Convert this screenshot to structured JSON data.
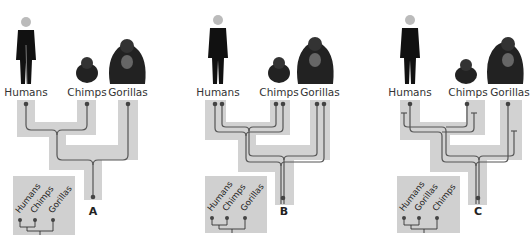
{
  "panels": [
    {
      "letter": "A",
      "species": [
        "Humans",
        "Chimps",
        "Gorillas"
      ],
      "inset_labels": [
        "Humans",
        "Chimps",
        "Gorillas"
      ],
      "gene_lines_per_species": 1
    },
    {
      "letter": "B",
      "species": [
        "Humans",
        "Chimps",
        "Gorillas"
      ],
      "inset_labels": [
        "Humans",
        "Chimps",
        "Gorillas"
      ],
      "gene_lines_per_species": 2
    },
    {
      "letter": "C",
      "species": [
        "Humans",
        "Chimps",
        "Gorillas"
      ],
      "inset_labels": [
        "Humans",
        "Gorillas",
        "Chimps"
      ],
      "gene_lines_per_species": 2
    }
  ],
  "colors": {
    "species_tree": "#d2d2d2",
    "gene_tree": "#555555",
    "inset_bg": "#d0d0d0"
  }
}
